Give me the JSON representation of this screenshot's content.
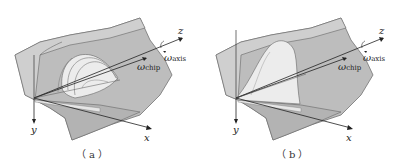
{
  "figure": {
    "panels": [
      {
        "id": "a",
        "caption": "（a）",
        "axes": {
          "x": "x",
          "y": "y",
          "z": "z"
        },
        "omega_chip": {
          "symbol": "ω",
          "sub": "chip"
        },
        "omega_axis": {
          "symbol": "ω",
          "sub": "axis"
        },
        "description": "Tool/chip surface with curled chip (multiple loops)"
      },
      {
        "id": "b",
        "caption": "（b）",
        "axes": {
          "x": "x",
          "y": "y",
          "z": "z"
        },
        "omega_chip": {
          "symbol": "ω",
          "sub": "chip"
        },
        "omega_axis": {
          "symbol": "ω",
          "sub": "axis"
        },
        "description": "Tool/chip surface with single chip face"
      }
    ],
    "colors": {
      "surface": "#bdbdbd",
      "surface_light": "#d4d4d4",
      "chip": "#ececec",
      "line": "#555555",
      "axis": "#222222"
    }
  }
}
